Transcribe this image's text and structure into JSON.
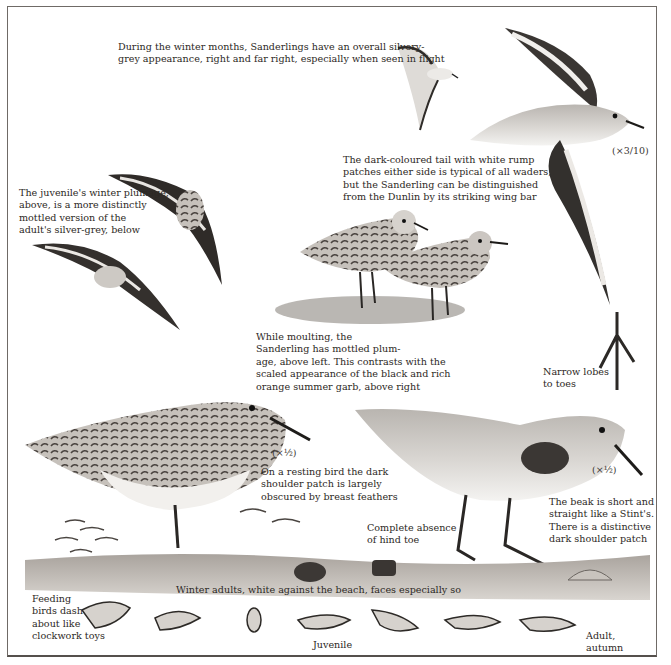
{
  "plate": {
    "subject": "Sanderling",
    "captions": {
      "winter_flight": "During the winter months, Sanderlings have an overall silvery-\ngrey appearance, right and far right, especially when seen in flight",
      "tail_rump": "The dark-coloured tail with white rump\npatches either side is typical of all waders,\nbut the Sanderling can be distinguished\nfrom the Dunlin by its striking wing bar",
      "juvenile_winter": "The juvenile's winter plumage,\nabove, is a more distinctly\nmottled version of the\nadult's silver-grey, below",
      "moulting": "While moulting, the\nSanderling has mottled plum-\nage, above left. This contrasts with the\nscaled appearance of the black and rich\norange summer garb, above right",
      "toes": "Narrow lobes\nto toes",
      "resting": "On a resting bird the dark\nshoulder patch is largely\nobscured by breast feathers",
      "beak": "The beak is short and\nstraight like a Stint's.\nThere is a distinctive\ndark shoulder patch",
      "hind_toe": "Complete absence\nof hind toe",
      "winter_adults": "Winter adults, white against the beach, faces especially so",
      "feeding": "Feeding\nbirds dash\nabout like\nclockwork toys",
      "juvenile_label": "Juvenile",
      "adult_autumn": "Adult,\nautumn"
    },
    "scales": {
      "flight_large": "(×3/10)",
      "resting_left": "(×½)",
      "standing_right": "(×½)"
    },
    "colors": {
      "ink": "#2a2622",
      "grey_plumage": "#a9a6a2",
      "dark_wing": "#2e2b29",
      "beach": "#8d8781",
      "paper": "#ffffff"
    }
  }
}
